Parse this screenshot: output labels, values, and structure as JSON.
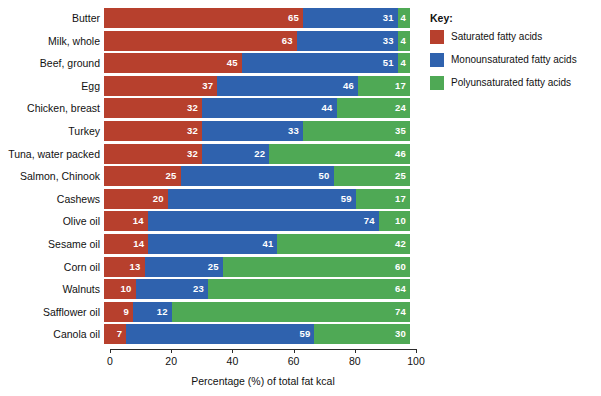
{
  "chart_data": {
    "type": "bar",
    "subtype": "stacked-horizontal-100percent",
    "title": "",
    "xlabel": "Percentage (%) of total fat kcal",
    "ylabel": "",
    "xlim": [
      0,
      100
    ],
    "xticks": [
      0,
      20,
      40,
      60,
      80,
      100
    ],
    "xtick_labels": [
      "0",
      "20",
      "40",
      "60",
      "80",
      "100"
    ],
    "grid": false,
    "legend_position": "right",
    "legend_title": "Key:",
    "categories": [
      "Butter",
      "Milk, whole",
      "Beef, ground",
      "Egg",
      "Chicken, breast",
      "Turkey",
      "Tuna, water packed",
      "Salmon, Chinook",
      "Cashews",
      "Olive oil",
      "Sesame oil",
      "Corn oil",
      "Walnuts",
      "Safflower oil",
      "Canola oil"
    ],
    "series": [
      {
        "name": "Saturated fatty acids",
        "color": "#b7402d",
        "values": [
          65,
          63,
          45,
          37,
          32,
          32,
          32,
          25,
          20,
          14,
          14,
          13,
          10,
          9,
          7
        ]
      },
      {
        "name": "Monounsaturated fatty acids",
        "color": "#2f62ae",
        "values": [
          31,
          33,
          51,
          46,
          44,
          33,
          22,
          50,
          59,
          74,
          41,
          25,
          23,
          12,
          59
        ]
      },
      {
        "name": "Polyunsaturated fatty acids",
        "color": "#4fa955",
        "values": [
          4,
          4,
          4,
          17,
          24,
          35,
          46,
          25,
          17,
          10,
          42,
          60,
          64,
          74,
          30
        ]
      }
    ]
  },
  "legend": {
    "title": "Key:",
    "items": [
      {
        "label": "Saturated fatty acids",
        "color": "#b7402d"
      },
      {
        "label": "Monounsaturated fatty acids",
        "color": "#2f62ae"
      },
      {
        "label": "Polyunsaturated fatty acids",
        "color": "#4fa955"
      }
    ]
  },
  "axis": {
    "x_title": "Percentage (%) of total fat kcal",
    "x_tick_labels": [
      "0",
      "20",
      "40",
      "60",
      "80",
      "100"
    ]
  },
  "colors": {
    "saturated": "#b7402d",
    "monounsaturated": "#2f62ae",
    "polyunsaturated": "#4fa955",
    "axis": "#2b2b2b",
    "text": "#111111",
    "value_label": "#ffffff",
    "background": "#ffffff"
  }
}
